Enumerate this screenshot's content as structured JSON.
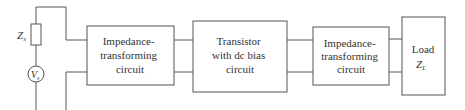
{
  "diagram": {
    "type": "amplifier block diagram",
    "source": {
      "impedance_label": "Z",
      "impedance_sub": "s",
      "voltage_label": "V",
      "voltage_sub": "s"
    },
    "blocks": [
      {
        "id": "input-match",
        "lines": [
          "Impedance-",
          "transforming",
          "circuit"
        ]
      },
      {
        "id": "transistor",
        "lines": [
          "Transistor",
          "with dc bias",
          "circuit"
        ]
      },
      {
        "id": "output-match",
        "lines": [
          "Impedance-",
          "transforming",
          "circuit"
        ]
      },
      {
        "id": "load",
        "lines": [
          "Load"
        ],
        "symbol": "Z",
        "symbol_sub": "L"
      }
    ],
    "colors": {
      "line": "#555555",
      "text": "#333333",
      "background": "#ffffff"
    }
  }
}
